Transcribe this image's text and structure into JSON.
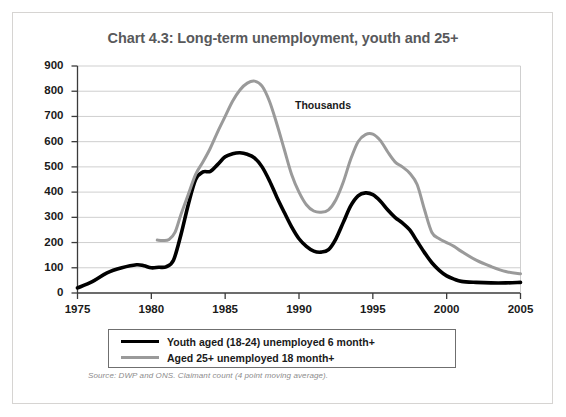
{
  "figure": {
    "title": "Chart 4.3: Long-term unemployment, youth and 25+",
    "source_note": "Source: DWP and ONS. Claimant count (4 point moving average).",
    "annotation": "Thousands",
    "border_color": "#d6d4d2",
    "title_color": "#58595b"
  },
  "legend": {
    "items": [
      {
        "label": "Youth aged (18-24) unemployed 6 month+",
        "color": "#000000",
        "swatch": "black"
      },
      {
        "label": "Aged 25+ unemployed 18 month+",
        "color": "#9a9a9a",
        "swatch": "grey"
      }
    ]
  },
  "chart_data": {
    "type": "line",
    "title": "Chart 4.3: Long-term unemployment, youth and 25+",
    "xlabel": "",
    "ylabel": "Thousands",
    "xlim": [
      1975,
      2005
    ],
    "ylim": [
      0,
      900
    ],
    "grid": true,
    "legend_position": "bottom",
    "xticks": [
      1975,
      1980,
      1985,
      1990,
      1995,
      2000,
      2005
    ],
    "xtick_labels": [
      "1975",
      "1980",
      "1985",
      "1990",
      "1995",
      "2000",
      "2005"
    ],
    "yticks": [
      0,
      100,
      200,
      300,
      400,
      500,
      600,
      700,
      800,
      900
    ],
    "ytick_labels": [
      "0",
      "100",
      "200",
      "300",
      "400",
      "500",
      "600",
      "700",
      "800",
      "900"
    ],
    "series": [
      {
        "name": "Youth aged (18-24) unemployed 6 month+",
        "color": "#000000",
        "x": [
          1975,
          1976,
          1977,
          1978,
          1979,
          1979.5,
          1980,
          1980.5,
          1981,
          1981.5,
          1982,
          1982.5,
          1983,
          1983.5,
          1984,
          1984.5,
          1985,
          1985.5,
          1986,
          1986.5,
          1987,
          1987.5,
          1988,
          1988.5,
          1989,
          1989.5,
          1990,
          1990.5,
          1991,
          1991.5,
          1992,
          1992.5,
          1993,
          1993.5,
          1994,
          1994.5,
          1995,
          1995.5,
          1996,
          1996.5,
          1997,
          1997.5,
          1998,
          1998.5,
          1999,
          1999.5,
          2000,
          2000.5,
          2001,
          2002,
          2003,
          2004,
          2005
        ],
        "y": [
          20,
          45,
          80,
          100,
          112,
          108,
          100,
          102,
          104,
          130,
          230,
          350,
          450,
          480,
          482,
          510,
          540,
          552,
          556,
          550,
          535,
          500,
          445,
          380,
          320,
          262,
          215,
          185,
          166,
          162,
          172,
          215,
          280,
          345,
          385,
          397,
          390,
          365,
          330,
          300,
          278,
          250,
          205,
          160,
          120,
          90,
          68,
          55,
          46,
          42,
          40,
          40,
          42
        ]
      },
      {
        "name": "Aged 25+ unemployed 18 month+",
        "color": "#9a9a9a",
        "x": [
          1980.4,
          1980.8,
          1981.2,
          1981.6,
          1982,
          1982.5,
          1983,
          1983.5,
          1984,
          1984.5,
          1985,
          1985.5,
          1986,
          1986.5,
          1987,
          1987.5,
          1988,
          1988.5,
          1989,
          1989.5,
          1990,
          1990.5,
          1991,
          1991.5,
          1992,
          1992.5,
          1993,
          1993.5,
          1994,
          1994.5,
          1995,
          1995.5,
          1996,
          1996.5,
          1997,
          1997.5,
          1998,
          1998.5,
          1999,
          1999.5,
          2000,
          2000.5,
          2001,
          2002,
          2003,
          2004,
          2005
        ],
        "y": [
          210,
          208,
          212,
          240,
          310,
          390,
          470,
          520,
          575,
          640,
          700,
          760,
          805,
          832,
          840,
          820,
          760,
          670,
          570,
          470,
          400,
          350,
          325,
          320,
          330,
          370,
          440,
          530,
          600,
          628,
          630,
          605,
          560,
          520,
          500,
          475,
          430,
          330,
          240,
          215,
          200,
          185,
          165,
          130,
          105,
          85,
          76
        ]
      }
    ]
  }
}
